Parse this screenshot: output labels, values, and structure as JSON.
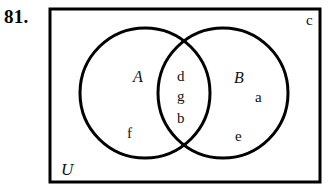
{
  "problem": {
    "number": "81."
  },
  "diagram": {
    "type": "venn-two-set",
    "universe_label": "U",
    "sets": [
      {
        "id": "A",
        "label": "A",
        "label_x": 135,
        "label_y": 70
      },
      {
        "id": "B",
        "label": "B",
        "label_x": 235,
        "label_y": 71
      }
    ],
    "regions": [
      {
        "id": "A-only",
        "name": "A only",
        "elements": [
          {
            "text": "f",
            "x": 128,
            "y": 127
          }
        ]
      },
      {
        "id": "A-and-B",
        "name": "A intersect B",
        "elements": [
          {
            "text": "d",
            "x": 178,
            "y": 70
          },
          {
            "text": "g",
            "x": 178,
            "y": 90
          },
          {
            "text": "b",
            "x": 178,
            "y": 112
          }
        ]
      },
      {
        "id": "B-only",
        "name": "B only",
        "elements": [
          {
            "text": "a",
            "x": 256,
            "y": 91
          },
          {
            "text": "e",
            "x": 236,
            "y": 130
          }
        ]
      },
      {
        "id": "outside",
        "name": "outside both sets",
        "elements": [
          {
            "text": "c",
            "x": 307,
            "y": 14
          }
        ]
      }
    ],
    "geometry": {
      "rect": {
        "x": 50,
        "y": 9,
        "width": 270,
        "height": 173,
        "stroke_width": 3
      },
      "circle_a": {
        "cx": 145,
        "cy": 93,
        "r": 65,
        "stroke_width": 3
      },
      "circle_b": {
        "cx": 223,
        "cy": 93,
        "r": 65,
        "stroke_width": 3
      }
    },
    "colors": {
      "stroke": "#000000",
      "background": "#ffffff",
      "text": "#111111"
    }
  }
}
